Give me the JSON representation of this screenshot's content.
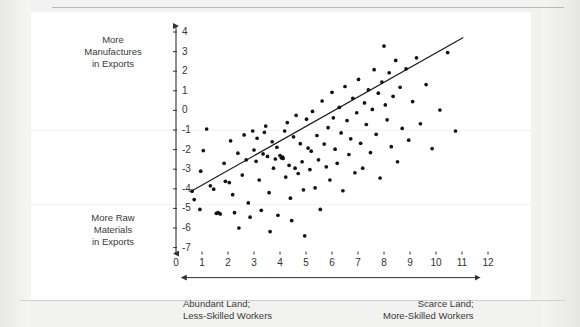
{
  "figure": {
    "axis_color": "#333333",
    "dot_color": "#111111",
    "line_color": "#1a1a1a",
    "ylabel_top": [
      "More",
      "Manufactures",
      "in Exports"
    ],
    "ylabel_bottom": [
      "More Raw",
      "Materials",
      "in Exports"
    ],
    "xcaption_left": [
      "Abundant Land;",
      "Less-Skilled Workers"
    ],
    "xcaption_right": [
      "Scarce Land;",
      "More-Skilled Workers"
    ]
  },
  "chart_data": {
    "type": "scatter",
    "title": "",
    "xlabel": "Abundant Land; Less-Skilled Workers  —  Scarce Land; More-Skilled Workers",
    "ylabel": "More Raw Materials in Exports  —  More Manufactures in Exports",
    "xlim": [
      0,
      12
    ],
    "ylim": [
      -7,
      4
    ],
    "xticks": [
      0,
      1,
      2,
      3,
      4,
      5,
      6,
      7,
      8,
      9,
      10,
      11,
      12
    ],
    "yticks": [
      4,
      3,
      2,
      1,
      0,
      -1,
      -2,
      -3,
      -4,
      -5,
      -6,
      -7
    ],
    "grid": false,
    "legend": false,
    "trendline": {
      "type": "linear",
      "x_start": 0.55,
      "y_start": -4.15,
      "x_end": 11.05,
      "y_end": 3.72
    },
    "points": [
      [
        0.62,
        -4.12
      ],
      [
        0.7,
        -4.55
      ],
      [
        0.95,
        -3.1
      ],
      [
        0.92,
        -5.05
      ],
      [
        1.05,
        -2.05
      ],
      [
        1.18,
        -0.95
      ],
      [
        1.32,
        -3.85
      ],
      [
        1.45,
        -4.02
      ],
      [
        1.55,
        -5.25
      ],
      [
        1.62,
        -5.22
      ],
      [
        1.7,
        -5.28
      ],
      [
        1.85,
        -2.7
      ],
      [
        1.9,
        -3.62
      ],
      [
        2.05,
        -3.68
      ],
      [
        2.1,
        -1.55
      ],
      [
        2.18,
        -4.3
      ],
      [
        2.25,
        -5.22
      ],
      [
        2.38,
        -2.18
      ],
      [
        2.42,
        -6.0
      ],
      [
        2.55,
        -3.3
      ],
      [
        2.62,
        -1.25
      ],
      [
        2.7,
        -2.52
      ],
      [
        2.78,
        -4.72
      ],
      [
        2.85,
        -5.45
      ],
      [
        2.95,
        -1.05
      ],
      [
        3.0,
        -2.02
      ],
      [
        3.08,
        -2.6
      ],
      [
        3.12,
        -1.42
      ],
      [
        3.2,
        -3.55
      ],
      [
        3.28,
        -5.1
      ],
      [
        3.35,
        -2.22
      ],
      [
        3.4,
        -1.12
      ],
      [
        3.45,
        -0.8
      ],
      [
        3.52,
        -2.35
      ],
      [
        3.58,
        -4.2
      ],
      [
        3.62,
        -6.18
      ],
      [
        3.7,
        -1.6
      ],
      [
        3.75,
        -2.95
      ],
      [
        3.82,
        -2.48
      ],
      [
        3.88,
        -1.88
      ],
      [
        3.92,
        -5.35
      ],
      [
        4.0,
        -2.3
      ],
      [
        4.05,
        -2.42
      ],
      [
        4.1,
        -2.38
      ],
      [
        4.12,
        -2.45
      ],
      [
        4.18,
        -1.05
      ],
      [
        4.22,
        -3.4
      ],
      [
        4.28,
        -0.62
      ],
      [
        4.35,
        -2.8
      ],
      [
        4.4,
        -4.48
      ],
      [
        4.45,
        -5.62
      ],
      [
        4.52,
        -1.35
      ],
      [
        4.58,
        -2.95
      ],
      [
        4.62,
        -0.25
      ],
      [
        4.7,
        -3.22
      ],
      [
        4.78,
        -1.7
      ],
      [
        4.85,
        -2.62
      ],
      [
        4.9,
        -4.05
      ],
      [
        4.95,
        -6.4
      ],
      [
        5.02,
        -0.45
      ],
      [
        5.08,
        -1.92
      ],
      [
        5.15,
        -3.02
      ],
      [
        5.2,
        -2.08
      ],
      [
        5.25,
        -0.05
      ],
      [
        5.35,
        -3.95
      ],
      [
        5.42,
        -1.28
      ],
      [
        5.48,
        -2.52
      ],
      [
        5.55,
        -5.05
      ],
      [
        5.62,
        0.48
      ],
      [
        5.7,
        -1.72
      ],
      [
        5.78,
        -2.88
      ],
      [
        5.85,
        -0.88
      ],
      [
        5.92,
        -3.55
      ],
      [
        6.0,
        0.92
      ],
      [
        6.05,
        -0.38
      ],
      [
        6.12,
        -1.98
      ],
      [
        6.2,
        -2.7
      ],
      [
        6.28,
        0.15
      ],
      [
        6.35,
        -1.15
      ],
      [
        6.42,
        -4.1
      ],
      [
        6.5,
        1.22
      ],
      [
        6.58,
        -0.52
      ],
      [
        6.65,
        -2.25
      ],
      [
        6.72,
        -1.45
      ],
      [
        6.8,
        0.62
      ],
      [
        6.88,
        -3.18
      ],
      [
        6.95,
        -0.12
      ],
      [
        7.02,
        1.58
      ],
      [
        7.1,
        -1.68
      ],
      [
        7.18,
        -2.95
      ],
      [
        7.25,
        0.38
      ],
      [
        7.32,
        -0.72
      ],
      [
        7.4,
        1.05
      ],
      [
        7.48,
        -2.15
      ],
      [
        7.55,
        0.05
      ],
      [
        7.62,
        2.08
      ],
      [
        7.7,
        -1.22
      ],
      [
        7.78,
        0.88
      ],
      [
        7.85,
        -3.45
      ],
      [
        7.92,
        1.45
      ],
      [
        8.0,
        3.28
      ],
      [
        8.05,
        0.28
      ],
      [
        8.12,
        -0.48
      ],
      [
        8.2,
        1.92
      ],
      [
        8.28,
        -1.85
      ],
      [
        8.35,
        0.72
      ],
      [
        8.45,
        2.55
      ],
      [
        8.52,
        -2.62
      ],
      [
        8.62,
        1.18
      ],
      [
        8.7,
        -0.92
      ],
      [
        8.85,
        2.12
      ],
      [
        8.95,
        -1.52
      ],
      [
        9.1,
        0.45
      ],
      [
        9.25,
        2.68
      ],
      [
        9.4,
        -0.68
      ],
      [
        9.62,
        1.32
      ],
      [
        9.85,
        -1.95
      ],
      [
        10.15,
        0.02
      ],
      [
        10.45,
        2.95
      ],
      [
        10.75,
        -1.05
      ]
    ]
  }
}
